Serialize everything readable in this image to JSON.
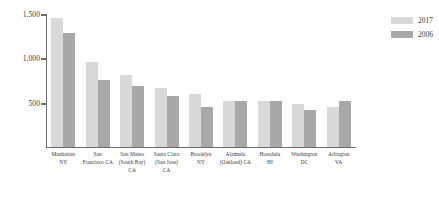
{
  "chart_data": {
    "type": "bar",
    "title": "",
    "subtitle": "",
    "xlabel": "",
    "ylabel": "",
    "ylim": [
      0,
      1500
    ],
    "yticks": [
      0,
      500,
      1000,
      1500
    ],
    "ytick_labels": [
      "0",
      "500",
      "1,000",
      "1,500"
    ],
    "grid": false,
    "legend_position": "top-right",
    "categories": [
      "Manhattan\nNY",
      "San\nFrancisco CA",
      "San Mateo\n(South Bay) CA",
      "Santa Clara\n(San Jose)\nCA",
      "Brooklyn\nNY",
      "Alameda\n(Oakland) CA",
      "Honolulu\nHI",
      "Washington\nDC",
      "Arlington\nVA"
    ],
    "category_lines": [
      [
        "Manhattan",
        "NY"
      ],
      [
        "San",
        "Francisco CA"
      ],
      [
        "San Mateo",
        "(South Bay) CA"
      ],
      [
        "Santa Clara",
        "(San Jose)",
        "CA"
      ],
      [
        "Brooklyn",
        "NY"
      ],
      [
        "Alameda",
        "(Oakland) CA"
      ],
      [
        "Honolulu",
        "HI"
      ],
      [
        "Washington",
        "DC"
      ],
      [
        "Arlington",
        "VA"
      ]
    ],
    "series": [
      {
        "name": "2017",
        "color": "#d9d9d9",
        "values": [
          1460,
          960,
          810,
          660,
          600,
          520,
          515,
          480,
          450
        ]
      },
      {
        "name": "2006",
        "color": "#a8a8a8",
        "values": [
          1290,
          755,
          690,
          570,
          450,
          520,
          515,
          420,
          520
        ]
      }
    ]
  },
  "legend": {
    "items": [
      {
        "label": "2017",
        "color": "#d9d9d9"
      },
      {
        "label": "2006",
        "color": "#a8a8a8"
      }
    ]
  },
  "axis": {
    "zero_label": "0"
  }
}
